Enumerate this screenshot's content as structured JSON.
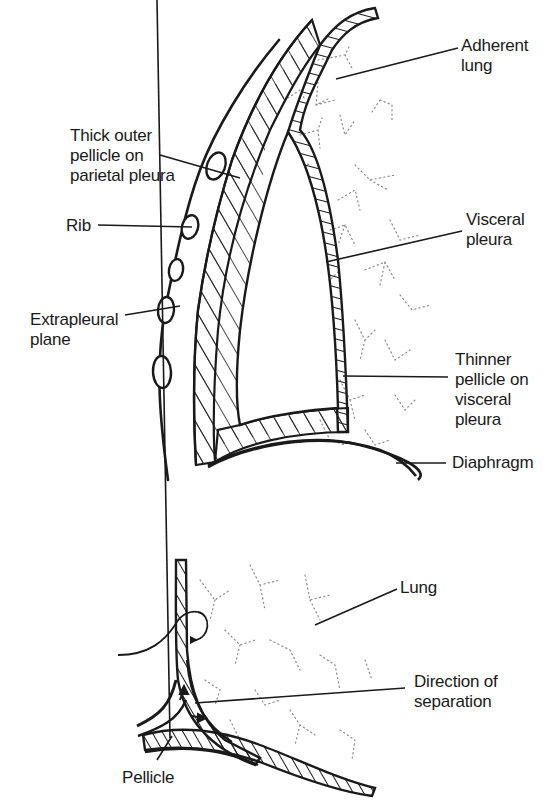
{
  "figure": {
    "upper_diagram": {
      "labels": {
        "adherent_lung": "Adherent\nlung",
        "thick_outer_pellicle": "Thick outer\npellicle on\nparietal pleura",
        "rib": "Rib",
        "visceral_pleura": "Visceral\npleura",
        "extrapleural_plane": "Extrapleural\nplane",
        "thinner_pellicle": "Thinner\npellicle on\nvisceral\npleura",
        "diaphragm": "Diaphragm"
      }
    },
    "lower_diagram": {
      "labels": {
        "lung": "Lung",
        "direction_of_separation": "Direction of\nseparation",
        "pellicle": "Pellicle"
      }
    },
    "colors": {
      "ink": "#1a1a1a",
      "lung_stipple": "#8a8a8a",
      "background": "#ffffff"
    }
  }
}
